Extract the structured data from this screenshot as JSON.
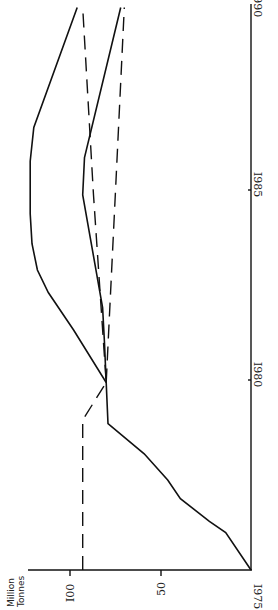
{
  "chart_data": {
    "type": "line",
    "orientation": "rotated-90-ccw",
    "title": "",
    "xlabel": "",
    "ylabel": "Million Tonnes",
    "xlim": [
      1975,
      1990
    ],
    "ylim": [
      0,
      110
    ],
    "x_ticks": [
      "1975",
      "1980",
      "1985",
      "1990"
    ],
    "y_ticks": [
      "50",
      "100"
    ],
    "grid": false,
    "legend": null,
    "series": [
      {
        "name": "Solid - upper",
        "style": "solid",
        "points": [
          [
            1975,
            0
          ],
          [
            1976,
            14
          ],
          [
            1976.3,
            23
          ],
          [
            1976.9,
            39
          ],
          [
            1977.4,
            46
          ],
          [
            1978.1,
            59
          ],
          [
            1978.9,
            79
          ],
          [
            1980,
            80
          ],
          [
            1981.4,
            98
          ],
          [
            1982.4,
            112
          ],
          [
            1983,
            118
          ],
          [
            1983.7,
            121
          ],
          [
            1984.5,
            122
          ],
          [
            1985.9,
            122
          ],
          [
            1986.8,
            120
          ],
          [
            1990,
            96
          ]
        ]
      },
      {
        "name": "Solid - lower",
        "style": "solid",
        "points": [
          [
            1980,
            80
          ],
          [
            1981.1,
            81
          ],
          [
            1982,
            82
          ],
          [
            1985,
            93
          ],
          [
            1986,
            92
          ],
          [
            1990,
            72
          ]
        ]
      },
      {
        "name": "Dashed - rising",
        "style": "dashed",
        "points": [
          [
            1975,
            93
          ],
          [
            1979,
            93
          ],
          [
            1980,
            80
          ],
          [
            1985,
            87
          ],
          [
            1990,
            93
          ]
        ]
      },
      {
        "name": "Dashed - falling",
        "style": "dashed",
        "points": [
          [
            1980,
            80
          ],
          [
            1985,
            75
          ],
          [
            1990,
            70
          ]
        ]
      }
    ]
  },
  "labels": {
    "ylabel_line1": "Million",
    "ylabel_line2": "Tonnes",
    "y100": "I00",
    "y50": "50",
    "x1975": "I975",
    "x1980": "I980",
    "x1985": "I985",
    "x1990": "I990"
  }
}
